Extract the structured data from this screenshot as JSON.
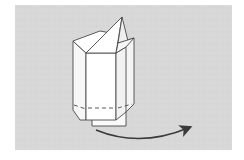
{
  "diagram": {
    "description": "Origami folding step: a folded paper tower/box with a pointed flap on top, with a curved arrow indicating rotation/turning to the right",
    "background_color": "#d6d6d6",
    "paper_color": "#ffffff",
    "line_color": "#4a4a4a",
    "arrow_color": "#3a3a3a",
    "elements": [
      {
        "name": "folded-model",
        "type": "origami-shape"
      },
      {
        "name": "rotate-arrow",
        "type": "curved-arrow",
        "direction": "right"
      }
    ]
  }
}
